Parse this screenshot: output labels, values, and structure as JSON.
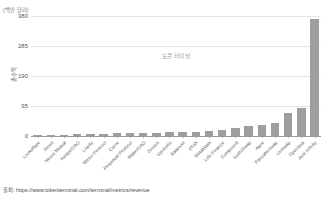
{
  "chart_data": {
    "type": "bar",
    "title": "",
    "subtitle": "",
    "unit_label": "(백만 달러)",
    "ylabel": "총수익",
    "xlabel": "",
    "watermark": "토큰 터미널",
    "ylim": [
      0,
      380
    ],
    "yticks": [
      380,
      285,
      190,
      95,
      0
    ],
    "ytick_labels": [
      "380",
      "285",
      "190",
      "95",
      "0"
    ],
    "grid": true,
    "legend": "none",
    "bar_color": "#9e9e9e",
    "categories": [
      "LooksRare",
      "Venus",
      "Nexus Mutual",
      "KeeperDAO",
      "Liquity",
      "Mirror Protocol",
      "Curve",
      "Perpetual Protocol",
      "MakerDAO",
      "Gnosis",
      "Synthetix",
      "Balancer",
      "dYdX",
      "MetaMask",
      "Lido Finance",
      "Compound",
      "SushiSwap",
      "Aave",
      "PancakeSwap",
      "Uniswap",
      "OpenSea",
      "Axie Infinity"
    ],
    "values": [
      2,
      3,
      4,
      5,
      6,
      7,
      8,
      9,
      10,
      11,
      12,
      13,
      14,
      16,
      19,
      24,
      33,
      34,
      42,
      73,
      88,
      372
    ]
  },
  "source": {
    "prefix": "출처:",
    "url": "https://www.tokenterminal.com/terminal/metrics/revenue",
    "full": "출처: https://www.tokenterminal.com/terminal/metrics/revenue"
  }
}
